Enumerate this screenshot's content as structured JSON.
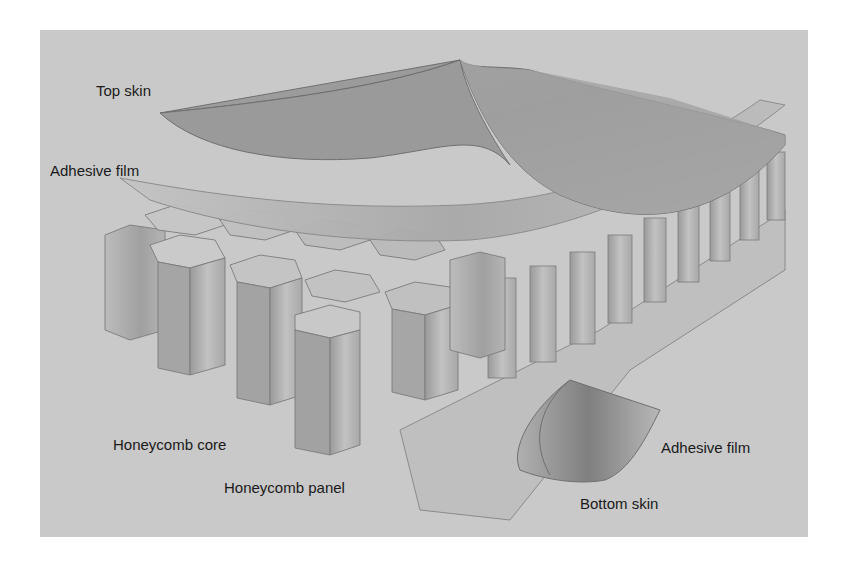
{
  "figure": {
    "background_color": "#c9c9c9",
    "labels": {
      "top_skin": "Top skin",
      "adhesive_film_top": "Adhesive film",
      "honeycomb_core": "Honeycomb core",
      "honeycomb_panel": "Honeycomb panel",
      "adhesive_film_bottom": "Adhesive film",
      "bottom_skin": "Bottom skin"
    }
  }
}
